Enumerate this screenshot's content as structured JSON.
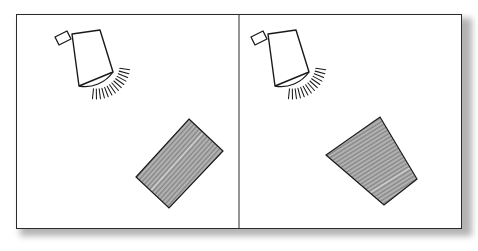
{
  "figure": {
    "panel_count": 2,
    "background_color": "#ffffff",
    "frame_color": "#2b2b2b",
    "shadow_color": "#9a9a9a",
    "ink_color": "#1a1a1a",
    "hatch_color": "#4a4a4a",
    "divider_label": "panel-divider"
  },
  "panels": [
    {
      "id": "panel-left",
      "label": "Left panel",
      "position": "left",
      "lamp": {
        "name": "cone-lamp",
        "label": "Cone lamp shade with light rays",
        "shade_points": "72,34 100,30 113,72 79,86",
        "stem_points": "55,37 67,31 71,39 59,45",
        "arc_path": "M 79,86 A 34 34 0 0 0 113,72",
        "ray_count": 14,
        "ray_origin_x": 96,
        "ray_origin_y": 65,
        "ray_inner_radius": 24,
        "ray_outer_radius": 34,
        "ray_start_angle": 8,
        "ray_end_angle": 96
      },
      "slab": {
        "name": "hatched-slab",
        "label": "Diagonally hatched rectangular slab",
        "corners": "189,119 223,151 169,208 136,177",
        "hatch_angle_deg": 42,
        "hatch_spacing_px": 1.4,
        "fill": "hatched-diagonal"
      }
    },
    {
      "id": "panel-right",
      "label": "Right panel",
      "position": "right",
      "lamp": {
        "name": "cone-lamp",
        "label": "Cone lamp shade with light rays",
        "shade_points": "268,34 296,30 309,72 275,86",
        "stem_points": "251,37 263,31 267,39 255,45",
        "arc_path": "M 275,86 A 34 34 0 0 0 309,72",
        "ray_count": 14,
        "ray_origin_x": 292,
        "ray_origin_y": 65,
        "ray_inner_radius": 24,
        "ray_outer_radius": 34,
        "ray_start_angle": 8,
        "ray_end_angle": 96
      },
      "slab": {
        "name": "hatched-slab",
        "label": "Diagonally hatched rectangular slab",
        "corners": "380,117 417,179 384,205 326,155",
        "hatch_angle_deg": 58,
        "hatch_spacing_px": 1.4,
        "fill": "hatched-diagonal"
      }
    }
  ],
  "divider": {
    "name": "panel-divider",
    "x": 239,
    "y_top": 15,
    "y_bottom": 228
  }
}
